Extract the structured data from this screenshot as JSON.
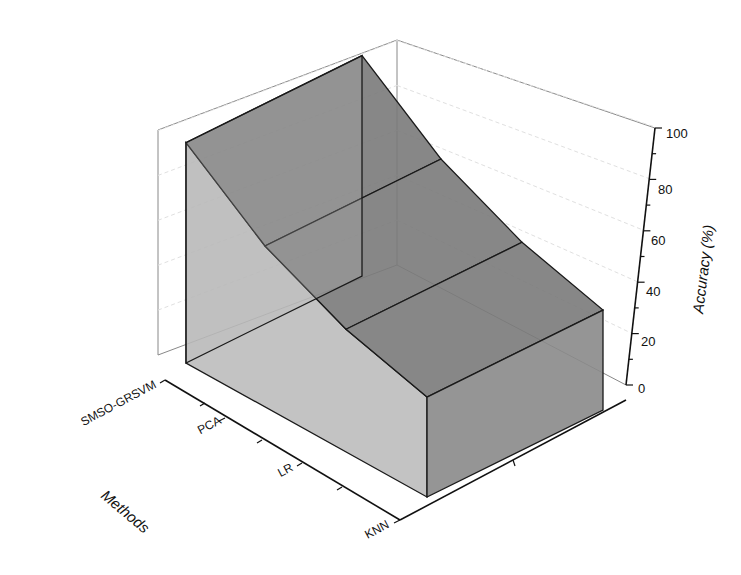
{
  "chart_data": {
    "type": "area",
    "subtype": "3d-wall-area",
    "title": "",
    "categories": [
      "SMSO-GRSVM",
      "PCA",
      "LR",
      "KNN"
    ],
    "series": [
      {
        "name": "Accuracy",
        "values": [
          97.5,
          70,
          52,
          38
        ]
      }
    ],
    "xlabel": "Methods",
    "ylabel": "",
    "zlabel": "Accuracy (%)",
    "zlim": [
      0,
      100
    ],
    "z_ticks": [
      0,
      20,
      40,
      60,
      80,
      100
    ],
    "grid": true,
    "legend": null,
    "colors": {
      "top_face": "#7a7a7a",
      "side_face": "#b9b9b9",
      "front_face": "#8a8a8a",
      "edge": "#1a1a1a",
      "gridline": "#dcdcdc",
      "box": "#888888"
    }
  },
  "labels": {
    "z_axis_title": "Accuracy (%)",
    "x_axis_title": "Methods",
    "z_ticks": [
      "0",
      "20",
      "40",
      "60",
      "80",
      "100"
    ],
    "categories": [
      "SMSO-GRSVM",
      "PCA",
      "LR",
      "KNN"
    ]
  }
}
